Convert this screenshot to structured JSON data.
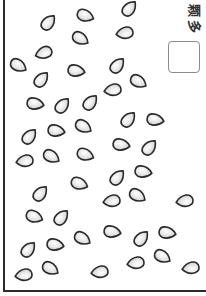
{
  "worksheet": {
    "unit_label_chars": [
      "颗",
      "多"
    ],
    "answer_box_value": "",
    "seed_count": 46
  },
  "colors": {
    "outline": "#2a2a2a",
    "seed_fill": "#e4e4e4",
    "seed_highlight": "#ffffff",
    "seed_shadow": "#c8c8c8",
    "frame": "#2b2b2b",
    "box_border": "#8c8c8c"
  },
  "seeds": [
    {
      "x": 49,
      "y": 22,
      "r": -50
    },
    {
      "x": 86,
      "y": 16,
      "r": 20
    },
    {
      "x": 130,
      "y": 8,
      "r": -50
    },
    {
      "x": 81,
      "y": 39,
      "r": 30
    },
    {
      "x": 124,
      "y": 33,
      "r": 170
    },
    {
      "x": 43,
      "y": 53,
      "r": 160
    },
    {
      "x": 19,
      "y": 66,
      "r": 30
    },
    {
      "x": 42,
      "y": 79,
      "r": -50
    },
    {
      "x": 77,
      "y": 71,
      "r": 10
    },
    {
      "x": 118,
      "y": 65,
      "r": -50
    },
    {
      "x": 139,
      "y": 82,
      "r": 30
    },
    {
      "x": 112,
      "y": 90,
      "r": 170
    },
    {
      "x": 36,
      "y": 104,
      "r": 10
    },
    {
      "x": 63,
      "y": 105,
      "r": -50
    },
    {
      "x": 91,
      "y": 102,
      "r": -50
    },
    {
      "x": 129,
      "y": 119,
      "r": -50
    },
    {
      "x": 156,
      "y": 120,
      "r": 10
    },
    {
      "x": 30,
      "y": 136,
      "r": -50
    },
    {
      "x": 57,
      "y": 131,
      "r": 10
    },
    {
      "x": 84,
      "y": 127,
      "r": 30
    },
    {
      "x": 122,
      "y": 145,
      "r": 10
    },
    {
      "x": 150,
      "y": 147,
      "r": -50
    },
    {
      "x": 24,
      "y": 161,
      "r": 170
    },
    {
      "x": 52,
      "y": 157,
      "r": 30
    },
    {
      "x": 86,
      "y": 155,
      "r": 20
    },
    {
      "x": 118,
      "y": 177,
      "r": -50
    },
    {
      "x": 144,
      "y": 172,
      "r": 10
    },
    {
      "x": 80,
      "y": 184,
      "r": 20
    },
    {
      "x": 41,
      "y": 193,
      "r": -50
    },
    {
      "x": 111,
      "y": 201,
      "r": 170
    },
    {
      "x": 138,
      "y": 196,
      "r": 30
    },
    {
      "x": 184,
      "y": 201,
      "r": 170
    },
    {
      "x": 35,
      "y": 217,
      "r": 20
    },
    {
      "x": 62,
      "y": 217,
      "r": -50
    },
    {
      "x": 83,
      "y": 239,
      "r": 30
    },
    {
      "x": 113,
      "y": 232,
      "r": 10
    },
    {
      "x": 142,
      "y": 238,
      "r": -50
    },
    {
      "x": 168,
      "y": 233,
      "r": 10
    },
    {
      "x": 29,
      "y": 249,
      "r": -50
    },
    {
      "x": 56,
      "y": 245,
      "r": 10
    },
    {
      "x": 135,
      "y": 263,
      "r": 170
    },
    {
      "x": 163,
      "y": 257,
      "r": 30
    },
    {
      "x": 190,
      "y": 268,
      "r": 170
    },
    {
      "x": 51,
      "y": 269,
      "r": 30
    },
    {
      "x": 23,
      "y": 275,
      "r": 170
    },
    {
      "x": 99,
      "y": 272,
      "r": 170
    }
  ]
}
